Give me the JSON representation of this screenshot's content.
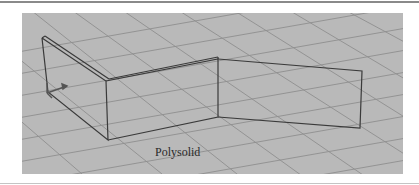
{
  "figure": {
    "label": "Polysolid",
    "viewport_background": "#b9b9b9",
    "grid_color": "#8c8c8c",
    "edge_color": "#3a3a3a",
    "object": "polysolid wall with three segments",
    "ucs_icon": "ucs-gizmo-icon"
  }
}
